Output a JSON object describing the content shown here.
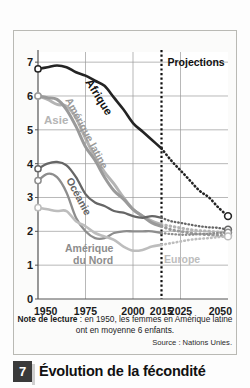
{
  "caption": {
    "badge": "7",
    "title": "Évolution de la fécondité"
  },
  "note": {
    "label": "Note de lecture",
    "text": " : en 1950, les femmes en Amérique latine ont en moyenne 6 enfants.",
    "source": "Source : Nations Unies."
  },
  "annotations": {
    "projections": "Projections",
    "projection_year": "2015"
  },
  "colors": {
    "afrique": "#242424",
    "asie": "#b4b4b4",
    "amerique_latine": "#9a9a9a",
    "oceanie": "#666666",
    "amerique_du_nord": "#8d8d8d",
    "europe": "#bdbdbd",
    "grid": "#9a9a9a",
    "axis": "#555555",
    "badge": "#3a3a3a"
  },
  "chart_data": {
    "type": "line",
    "title": "Évolution de la fécondité",
    "xlabel": "",
    "ylabel": "",
    "xlim": [
      1950,
      2050
    ],
    "ylim": [
      0,
      7.3
    ],
    "grid": true,
    "legend": "inline-labels",
    "xticks": [
      1950,
      1975,
      2000,
      2015,
      2025,
      2050
    ],
    "yticks": [
      0,
      1,
      2,
      3,
      4,
      5,
      6,
      7
    ],
    "projection_start": 2015,
    "x": [
      1950,
      1955,
      1960,
      1965,
      1970,
      1975,
      1980,
      1985,
      1990,
      1995,
      2000,
      2005,
      2010,
      2015,
      2020,
      2025,
      2030,
      2035,
      2040,
      2045,
      2050
    ],
    "series": [
      {
        "name": "Afrique",
        "label": "Afrique",
        "color": "#242424",
        "values": [
          6.8,
          6.85,
          6.9,
          6.85,
          6.7,
          6.6,
          6.45,
          6.3,
          5.95,
          5.6,
          5.2,
          4.95,
          4.7,
          4.45,
          4.1,
          3.8,
          3.5,
          3.2,
          3.0,
          2.7,
          2.45
        ]
      },
      {
        "name": "Asie",
        "label": "Asie",
        "color": "#b4b4b4",
        "values": [
          6.0,
          5.9,
          5.75,
          5.7,
          5.35,
          4.75,
          4.2,
          3.75,
          3.4,
          3.0,
          2.65,
          2.45,
          2.3,
          2.2,
          2.15,
          2.1,
          2.05,
          2.02,
          2.0,
          1.98,
          1.97
        ]
      },
      {
        "name": "Amérique latine",
        "label": "Amérique latine",
        "color": "#9a9a9a",
        "values": [
          6.0,
          5.95,
          5.9,
          5.6,
          5.1,
          4.5,
          4.1,
          3.6,
          3.2,
          2.95,
          2.65,
          2.45,
          2.25,
          2.15,
          2.05,
          2.0,
          1.95,
          1.92,
          1.9,
          1.88,
          1.87
        ]
      },
      {
        "name": "Océanie",
        "label": "Océanie",
        "color": "#666666",
        "values": [
          3.85,
          4.0,
          4.05,
          3.95,
          3.6,
          3.1,
          2.85,
          2.75,
          2.6,
          2.55,
          2.45,
          2.4,
          2.45,
          2.4,
          2.3,
          2.25,
          2.2,
          2.15,
          2.12,
          2.1,
          2.05
        ]
      },
      {
        "name": "Amérique du Nord",
        "label": "Amérique du Nord",
        "color": "#8d8d8d",
        "values": [
          3.5,
          3.7,
          3.6,
          3.15,
          2.4,
          2.0,
          1.8,
          1.8,
          1.95,
          2.0,
          2.0,
          2.0,
          2.0,
          1.95,
          1.92,
          1.9,
          1.9,
          1.92,
          1.93,
          1.95,
          1.96
        ]
      },
      {
        "name": "Europe",
        "label": "Europe",
        "color": "#bdbdbd",
        "values": [
          2.7,
          2.65,
          2.6,
          2.6,
          2.3,
          2.15,
          1.95,
          1.85,
          1.75,
          1.55,
          1.43,
          1.45,
          1.55,
          1.6,
          1.65,
          1.7,
          1.75,
          1.78,
          1.8,
          1.83,
          1.85
        ]
      }
    ],
    "inline_labels": [
      {
        "text": "Afrique",
        "series": "Afrique"
      },
      {
        "text": "Asie",
        "series": "Asie"
      },
      {
        "text": "Amérique latine",
        "series": "Amérique latine"
      },
      {
        "text": "Océanie",
        "series": "Océanie"
      },
      {
        "text": "Amérique du Nord",
        "series": "Amérique du Nord"
      },
      {
        "text": "Europe",
        "series": "Europe"
      }
    ]
  }
}
